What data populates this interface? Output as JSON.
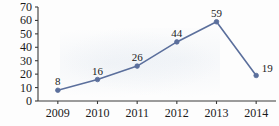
{
  "chart_data": {
    "type": "line",
    "title": "",
    "xlabel": "",
    "ylabel": "",
    "categories": [
      "2009",
      "2010",
      "2011",
      "2012",
      "2013",
      "2014"
    ],
    "values": [
      8,
      16,
      26,
      44,
      59,
      19
    ],
    "point_labels": [
      "8",
      "16",
      "26",
      "44",
      "59",
      "19"
    ],
    "yticks": [
      "0",
      "10",
      "20",
      "30",
      "40",
      "50",
      "60",
      "70"
    ],
    "ytick_values": [
      0,
      10,
      20,
      30,
      40,
      50,
      60,
      70
    ],
    "ylim": [
      0,
      70
    ],
    "grid": false,
    "legend": false,
    "series_color": "#5b6f9c",
    "marker": "circle",
    "axis_color": "#3a3a3a",
    "text_color": "#1a1a1a"
  }
}
